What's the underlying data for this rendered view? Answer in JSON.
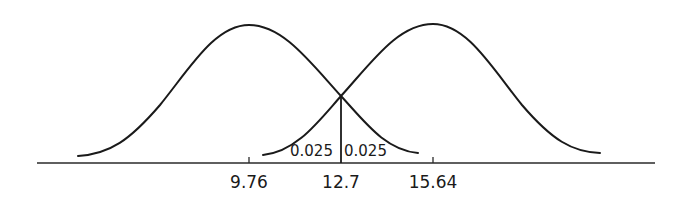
{
  "diagram": {
    "type": "two-normal-distributions",
    "axis_ticks": [
      {
        "value": "9.76",
        "x": 249
      },
      {
        "value": "12.7",
        "x": 341
      },
      {
        "value": "15.64",
        "x": 433
      }
    ],
    "area_labels": {
      "left_tail": "0.025",
      "right_tail": "0.025"
    },
    "curves": [
      {
        "name": "left-distribution",
        "mean": "9.76"
      },
      {
        "name": "right-distribution",
        "mean": "15.64"
      }
    ],
    "critical_value": "12.7",
    "colors": {
      "line": "#1a1a1a",
      "background": "#ffffff"
    }
  }
}
